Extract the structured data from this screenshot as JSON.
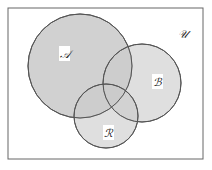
{
  "diagram": {
    "type": "venn",
    "universe_label": "𝒰",
    "sets": [
      {
        "id": "A",
        "label": "𝒜",
        "cx": 80,
        "cy": 66,
        "r": 52
      },
      {
        "id": "B",
        "label": "ℬ",
        "cx": 142,
        "cy": 83,
        "r": 39
      },
      {
        "id": "R",
        "label": "ℛ",
        "cx": 106,
        "cy": 116,
        "r": 32
      }
    ],
    "colors": {
      "fill": "#c9c9c9",
      "stroke": "#555555",
      "frame": "#666666",
      "label_bg": "#ffffff"
    }
  }
}
